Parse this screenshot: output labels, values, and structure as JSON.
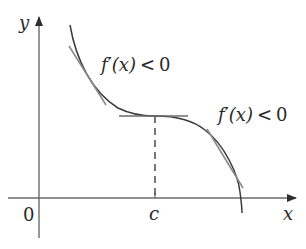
{
  "diagram": {
    "type": "function-graph",
    "axes": {
      "x_label": "x",
      "y_label": "y",
      "origin_label": "0",
      "point_label": "c"
    },
    "annotations": [
      {
        "id": "left",
        "func": "f",
        "prime": "′",
        "arg": "(x)",
        "relation": "<",
        "value": "0"
      },
      {
        "id": "right",
        "func": "f",
        "prime": "′",
        "arg": "(x)",
        "relation": "<",
        "value": "0"
      }
    ],
    "features": {
      "curve": "decreasing, with horizontal tangent at x = c (inflection point)",
      "tangents": [
        "left-decreasing",
        "horizontal-at-c",
        "right-decreasing"
      ],
      "dashed_line": "vertical from curve at c down to x-axis"
    },
    "colors": {
      "axis": "#6b6b6b",
      "curve": "#3a3a3a",
      "tangent": "#8a8a8a",
      "text": "#2a2a2a"
    }
  }
}
